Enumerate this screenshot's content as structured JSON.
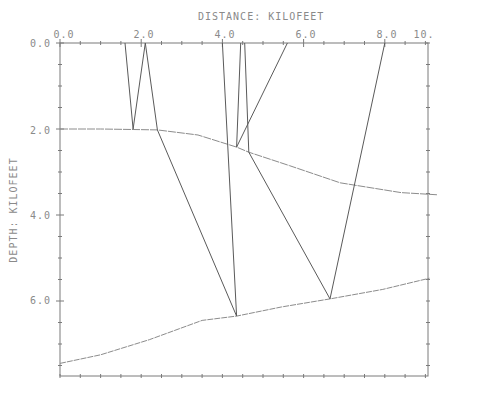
{
  "chart_data": {
    "type": "line",
    "title": "",
    "xlabel": "DISTANCE: KILOFEET",
    "ylabel": "DEPTH: KILOFEET",
    "x_ticks": [
      "0.0",
      "2.0",
      "4.0",
      "6.0",
      "8.0",
      "10."
    ],
    "y_ticks": [
      "0.0",
      "2.0",
      "4.0",
      "6.0"
    ],
    "xlim": [
      0,
      9.1
    ],
    "ylim": [
      7.75,
      0
    ],
    "x_axis_position": "top",
    "grid": false,
    "legend": null,
    "series": [
      {
        "name": "reflector-1",
        "style": "line",
        "x": [
          0.0,
          1.0,
          2.4,
          3.4,
          4.35,
          4.65,
          5.65,
          6.9,
          8.4,
          9.3
        ],
        "y": [
          2.0,
          2.0,
          2.02,
          2.14,
          2.42,
          2.54,
          2.85,
          3.25,
          3.48,
          3.53
        ]
      },
      {
        "name": "reflector-2",
        "style": "line",
        "x": [
          0.0,
          1.0,
          2.2,
          3.5,
          4.35,
          5.45,
          6.65,
          7.95,
          9.1
        ],
        "y": [
          7.45,
          7.25,
          6.9,
          6.45,
          6.35,
          6.14,
          5.95,
          5.73,
          5.47
        ]
      },
      {
        "name": "ray-paths",
        "style": "segments",
        "segments": [
          [
            [
              1.6,
              0.0
            ],
            [
              1.8,
              2.0
            ],
            [
              2.1,
              0.0
            ],
            [
              2.4,
              2.02
            ],
            [
              4.35,
              6.35
            ],
            [
              4.0,
              0.0
            ]
          ],
          [
            [
              4.45,
              0.0
            ],
            [
              4.35,
              2.42
            ],
            [
              5.6,
              0.0
            ]
          ],
          [
            [
              4.55,
              0.0
            ],
            [
              4.65,
              2.54
            ],
            [
              6.65,
              5.95
            ],
            [
              8.0,
              0.0
            ]
          ]
        ]
      }
    ]
  },
  "axes": {
    "x_title": "DISTANCE: KILOFEET",
    "y_title": "DEPTH: KILOFEET",
    "x_tick_labels": [
      "0.0",
      "2.0",
      "4.0",
      "6.0",
      "8.0",
      "10."
    ],
    "y_tick_labels": [
      "0.0",
      "2.0",
      "4.0",
      "6.0"
    ]
  },
  "colors": {
    "frame": "#7a7a7a",
    "ray": "#5a5a5a",
    "reflector": "#8c8c8c",
    "text": "#8a8a8a"
  }
}
